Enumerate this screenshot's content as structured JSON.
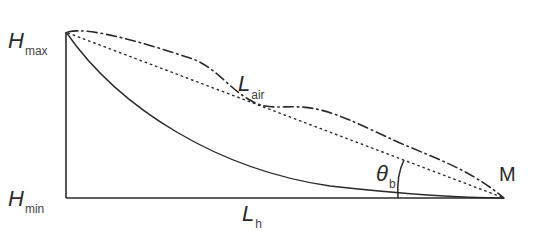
{
  "diagram": {
    "labels": {
      "h_max": {
        "main": "H",
        "sub": "max"
      },
      "h_min": {
        "main": "H",
        "sub": "min"
      },
      "l_air": {
        "main": "L",
        "sub": "air"
      },
      "l_h": {
        "main": "L",
        "sub": "h"
      },
      "theta_b": {
        "main": "θ",
        "sub": "b"
      },
      "m": {
        "main": "M"
      }
    },
    "colors": {
      "stroke": "#2a2a2a",
      "background": "#ffffff"
    },
    "curves": [
      {
        "id": "solid-curve",
        "style": "solid",
        "description": "concave profile from H_max to M"
      },
      {
        "id": "dotted-line",
        "style": "dotted",
        "description": "straight line from H_max to M"
      },
      {
        "id": "dash-dot-line",
        "style": "dash-dot",
        "description": "wavy air path L_air from H_max to M"
      }
    ]
  }
}
